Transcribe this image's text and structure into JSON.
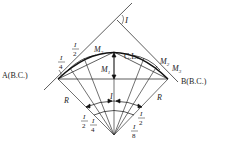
{
  "diagram": {
    "colors": {
      "line": "#333333",
      "curve": "#111111",
      "background": "#ffffff"
    },
    "labels": {
      "point_a": "A(B.C.)",
      "point_b": "B(B.C.)",
      "centerline": "C.L.",
      "intersection_angle": "I",
      "radius_left": "R",
      "radius_right": "R",
      "m1": "M",
      "m1_sub": "1",
      "m2_left": "M",
      "m2_left_sub": "2",
      "m2_right": "M",
      "m2_right_sub": "2",
      "m3": "M",
      "m3_sub": "3",
      "center_angle": "I"
    },
    "fractions": {
      "top_i4": {
        "num": "I",
        "den": "4"
      },
      "top_i2": {
        "num": "I",
        "den": "2"
      },
      "bottom_left_i2": {
        "num": "I",
        "den": "2"
      },
      "bottom_left_i4": {
        "num": "I",
        "den": "4"
      },
      "bottom_right_i8": {
        "num": "I",
        "den": "8"
      },
      "bottom_right_i2": {
        "num": "I",
        "den": "2"
      }
    }
  }
}
